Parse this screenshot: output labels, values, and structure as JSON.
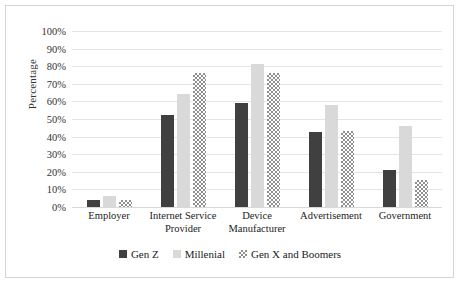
{
  "chart_data": {
    "type": "bar",
    "title": "",
    "xlabel": "",
    "ylabel": "Percentage",
    "ylim": [
      0,
      100
    ],
    "ytick_labels": [
      "100%",
      "90%",
      "80%",
      "70%",
      "60%",
      "50%",
      "40%",
      "30%",
      "20%",
      "10%",
      "0%"
    ],
    "ytick_values": [
      100,
      90,
      80,
      70,
      60,
      50,
      40,
      30,
      20,
      10,
      0
    ],
    "grid": true,
    "legend_position": "bottom",
    "categories": [
      "Employer",
      "Internet Service Provider",
      "Device Manufacturer",
      "Advertisement",
      "Government"
    ],
    "series": [
      {
        "name": "Gen Z",
        "color": "#404040",
        "pattern": "solid",
        "values": [
          4,
          52,
          59,
          42.5,
          21
        ]
      },
      {
        "name": "Millenial",
        "color": "#d9d9d9",
        "pattern": "solid",
        "values": [
          6,
          64,
          81,
          58,
          46
        ]
      },
      {
        "name": "Gen X and Boomers",
        "color": "#8f8f8f",
        "pattern": "checkered",
        "values": [
          4,
          76,
          76,
          43,
          15.5
        ]
      }
    ]
  },
  "colors": {
    "gen_z": "#404040",
    "millenial": "#d9d9d9",
    "gen_x_boomers": "#8f8f8f",
    "gridline": "#e4e4e4",
    "border": "#d5d5d5",
    "background": "#ffffff"
  }
}
